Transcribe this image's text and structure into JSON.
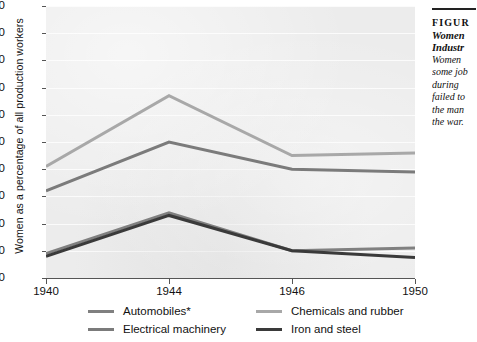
{
  "chart_data": {
    "type": "line",
    "title": "",
    "xlabel": "",
    "ylabel": "Women as a percentage of all production workers",
    "categories": [
      "1940",
      "1944",
      "1946",
      "1950"
    ],
    "x": [
      1940,
      1944,
      1946,
      1950
    ],
    "ylim": [
      0,
      100
    ],
    "yticks": [
      0,
      10,
      20,
      30,
      40,
      50,
      60,
      70,
      80,
      90,
      100
    ],
    "grid": true,
    "legend_position": "bottom",
    "series": [
      {
        "name": "Chemicals and rubber",
        "color": "#a8a8a8",
        "values": [
          41,
          67,
          45,
          46
        ]
      },
      {
        "name": "Electrical machinery",
        "color": "#7b7b7b",
        "values": [
          32,
          50,
          40,
          39
        ]
      },
      {
        "name": "Automobiles*",
        "color": "#808080",
        "values": [
          9,
          24,
          10,
          11
        ]
      },
      {
        "name": "Iron and steel",
        "color": "#3a3a3a",
        "values": [
          8,
          23,
          10,
          7.5
        ]
      }
    ]
  },
  "axes": {
    "y_title": "Women as a percentage of all production workers",
    "y_labels": [
      "100",
      "90",
      "80",
      "70",
      "60",
      "50",
      "40",
      "30",
      "20",
      "10",
      "0"
    ],
    "x_labels": [
      "1940",
      "1944",
      "1946",
      "1950"
    ]
  },
  "legend": {
    "items": [
      {
        "label": "Automobiles*",
        "color": "#808080"
      },
      {
        "label": "Chemicals and rubber",
        "color": "#a8a8a8"
      },
      {
        "label": "Electrical machinery",
        "color": "#7b7b7b"
      },
      {
        "label": "Iron and steel",
        "color": "#3a3a3a"
      }
    ]
  },
  "caption": {
    "figure_label": "FIGUR",
    "title_lines": [
      "Women",
      "Industr"
    ],
    "body_lines": [
      "Women",
      "some job",
      "during ",
      "failed to",
      "the man",
      "the war."
    ]
  }
}
